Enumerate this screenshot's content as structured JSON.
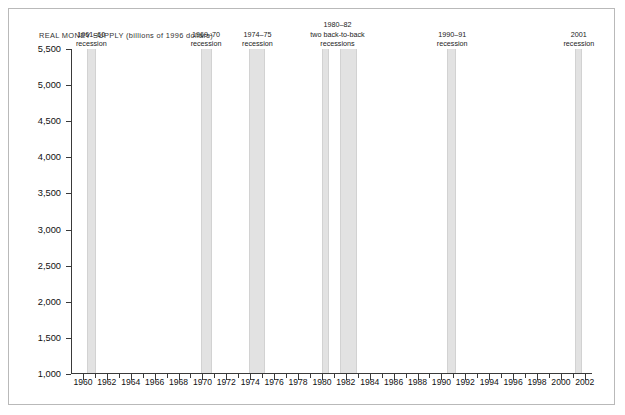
{
  "chart_title": "REAL MONEY SUPPLY (billions of 1996 dollars)",
  "axis": {
    "y_labels": [
      "5,500",
      "5,000",
      "4,500",
      "4,000",
      "3,500",
      "3,000",
      "2,500",
      "2,000",
      "1,500",
      "1,000"
    ],
    "y_values": [
      5500,
      5000,
      4500,
      4000,
      3500,
      3000,
      2500,
      2000,
      1500,
      1000
    ],
    "x_labels": [
      "1960",
      "1962",
      "1964",
      "1966",
      "1968",
      "1970",
      "1972",
      "1974",
      "1976",
      "1978",
      "1980",
      "1982",
      "1984",
      "1986",
      "1988",
      "1990",
      "1992",
      "1994",
      "1996",
      "1998",
      "2000",
      "2002"
    ],
    "x_label_values": [
      1960,
      1962,
      1964,
      1966,
      1968,
      1970,
      1972,
      1974,
      1976,
      1978,
      1980,
      1982,
      1984,
      1986,
      1988,
      1990,
      1992,
      1994,
      1996,
      1998,
      2000,
      2002
    ]
  },
  "recessions": [
    {
      "name": "recession-1960-61",
      "label_lines": [
        "1961–60",
        "recession"
      ],
      "start": 1960.3,
      "end": 1961.1,
      "caption_center": 1960.7
    },
    {
      "name": "recession-1969-70",
      "label_lines": [
        "1969–70",
        "recession"
      ],
      "start": 1969.9,
      "end": 1970.8,
      "caption_center": 1970.3
    },
    {
      "name": "recession-1974-75",
      "label_lines": [
        "1974–75",
        "recession"
      ],
      "start": 1973.9,
      "end": 1975.2,
      "caption_center": 1974.6
    },
    {
      "name": "recession-1980-82",
      "label_lines": [
        "1980–82",
        "two back-to-back",
        "recessions"
      ],
      "start": 1980.0,
      "end": 1980.6,
      "caption_center": 1981.3
    },
    {
      "name": "recession-1981-82-second",
      "label_lines": [],
      "start": 1981.5,
      "end": 1982.9,
      "caption_center": null
    },
    {
      "name": "recession-1990-91",
      "label_lines": [
        "1990–91",
        "recession"
      ],
      "start": 1990.5,
      "end": 1991.2,
      "caption_center": 1990.9
    },
    {
      "name": "recession-2001",
      "label_lines": [
        "2001",
        "recession"
      ],
      "start": 2001.2,
      "end": 2001.8,
      "caption_center": 2001.5
    }
  ],
  "chart_data": {
    "type": "area",
    "title": "REAL MONEY SUPPLY (billions of 1996 dollars)",
    "xlabel": "",
    "ylabel": "billions of 1996 dollars",
    "xlim": [
      1959,
      2002.6
    ],
    "ylim": [
      1000,
      5500
    ],
    "grid": false,
    "legend": "none",
    "line_color": "#404040",
    "fill_color": "#d9d9d9",
    "band_color": "#e2e2e2",
    "x": [
      1959,
      1960,
      1961,
      1962,
      1963,
      1964,
      1965,
      1966,
      1967,
      1968,
      1969,
      1970,
      1971,
      1972,
      1973,
      1974,
      1975,
      1976,
      1977,
      1978,
      1979,
      1980,
      1981,
      1982,
      1983,
      1984,
      1985,
      1986,
      1987,
      1988,
      1989,
      1990,
      1991,
      1992,
      1993,
      1994,
      1995,
      1996,
      1997,
      1998,
      1999,
      2000,
      2001,
      2002
    ],
    "values": [
      1370,
      1395,
      1450,
      1510,
      1570,
      1640,
      1700,
      1760,
      1830,
      1900,
      1960,
      2010,
      2065,
      2150,
      2290,
      2480,
      2490,
      2430,
      2490,
      2580,
      2680,
      2740,
      2745,
      2745,
      2870,
      2980,
      3100,
      3280,
      3420,
      3520,
      3580,
      3660,
      3690,
      3690,
      3680,
      3630,
      3560,
      3600,
      3680,
      3800,
      3960,
      4180,
      4480,
      5150
    ],
    "series": [
      {
        "name": "Real money supply (billions of 1996 dollars)",
        "values": [
          1370,
          1395,
          1450,
          1510,
          1570,
          1640,
          1700,
          1760,
          1830,
          1900,
          1960,
          2010,
          2065,
          2150,
          2290,
          2480,
          2490,
          2430,
          2490,
          2580,
          2680,
          2740,
          2745,
          2745,
          2870,
          2980,
          3100,
          3280,
          3420,
          3520,
          3580,
          3660,
          3690,
          3690,
          3680,
          3630,
          3560,
          3600,
          3680,
          3800,
          3960,
          4180,
          4480,
          5150
        ]
      }
    ],
    "annotations": [
      {
        "text": "1961–60 recession",
        "x_start": 1960.3,
        "x_end": 1961.1
      },
      {
        "text": "1969–70 recession",
        "x_start": 1969.9,
        "x_end": 1970.8
      },
      {
        "text": "1974–75 recession",
        "x_start": 1973.9,
        "x_end": 1975.2
      },
      {
        "text": "1980–82 two back-to-back recessions",
        "x_start": 1980.0,
        "x_end": 1982.9
      },
      {
        "text": "1990–91 recession",
        "x_start": 1990.5,
        "x_end": 1991.2
      },
      {
        "text": "2001 recession",
        "x_start": 2001.2,
        "x_end": 2001.8
      }
    ]
  }
}
